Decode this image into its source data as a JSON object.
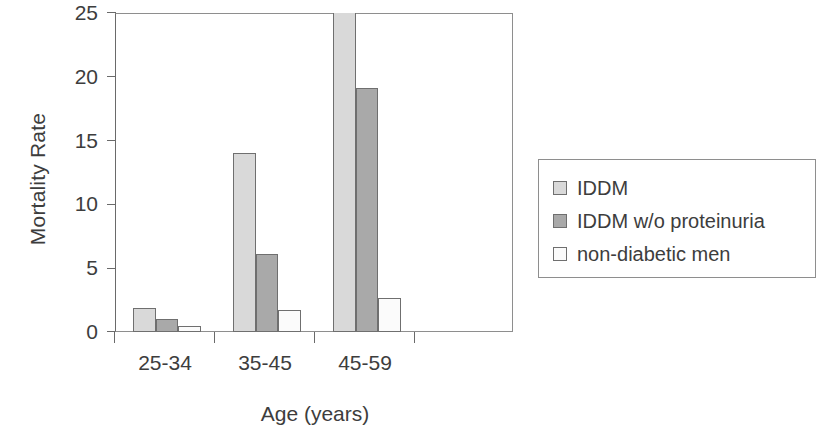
{
  "chart_data": {
    "type": "bar",
    "title": "",
    "xlabel": "Age (years)",
    "ylabel": "Mortality Rate",
    "categories": [
      "25-34",
      "35-45",
      "45-59"
    ],
    "series": [
      {
        "name": "IDDM",
        "color": "#d9d9d9",
        "values": [
          1.9,
          14.0,
          25.0
        ]
      },
      {
        "name": "IDDM w/o proteinuria",
        "color": "#a9a9a9",
        "values": [
          1.0,
          6.1,
          19.1
        ]
      },
      {
        "name": "non-diabetic men",
        "color": "#fbfbfb",
        "values": [
          0.5,
          1.7,
          2.7
        ]
      }
    ],
    "ylim": [
      0,
      25
    ],
    "yticks": [
      0,
      5,
      10,
      15,
      20,
      25
    ],
    "ytick_labels": [
      "0",
      "5",
      "10",
      "15",
      "20",
      "25"
    ],
    "grid": false,
    "legend_position": "right"
  },
  "axes": {
    "y_title": "Mortality Rate",
    "x_title": "Age (years)"
  },
  "legend": {
    "entries": [
      {
        "label": "IDDM",
        "swatch": "light-gray"
      },
      {
        "label": "IDDM w/o proteinuria",
        "swatch": "medium-gray"
      },
      {
        "label": "non-diabetic men",
        "swatch": "white"
      }
    ]
  },
  "colors": {
    "series_1": "#d9d9d9",
    "series_2": "#a9a9a9",
    "series_3": "#fbfbfb",
    "axis": "#6a6a6a",
    "text": "#3d3d3d"
  }
}
